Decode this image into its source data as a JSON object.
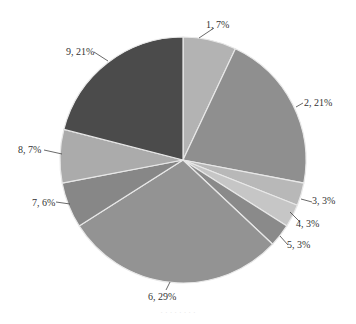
{
  "chart_data": {
    "type": "pie",
    "title": "",
    "start_angle_deg": 0,
    "direction": "clockwise",
    "slices": [
      {
        "name": "1",
        "value": 7,
        "label": "1, 7%",
        "color": "#b3b3b3"
      },
      {
        "name": "2",
        "value": 21,
        "label": "2, 21%",
        "color": "#8f8f8f"
      },
      {
        "name": "3",
        "value": 3,
        "label": "3, 3%",
        "color": "#b8b8b8"
      },
      {
        "name": "4",
        "value": 3,
        "label": "4, 3%",
        "color": "#c6c6c6"
      },
      {
        "name": "5",
        "value": 3,
        "label": "5, 3%",
        "color": "#8a8a8a"
      },
      {
        "name": "6",
        "value": 29,
        "label": "6, 29%",
        "color": "#939393"
      },
      {
        "name": "7",
        "value": 6,
        "label": "7, 6%",
        "color": "#878787"
      },
      {
        "name": "8",
        "value": 7,
        "label": "8, 7%",
        "color": "#ababab"
      },
      {
        "name": "9",
        "value": 21,
        "label": "9, 21%",
        "color": "#4b4b4b"
      }
    ],
    "legend": "none",
    "data_labels": "outside with leader lines"
  },
  "layout": {
    "center": [
      183,
      160
    ],
    "radius": 123,
    "separator_color": "#e8e8e8"
  },
  "label_positions": [
    {
      "x": 206,
      "y": 28,
      "anchor": "start",
      "lx1": 199,
      "ly1": 38,
      "lx2": 214,
      "ly2": 28
    },
    {
      "x": 304,
      "y": 106,
      "anchor": "start",
      "lx1": 296,
      "ly1": 107,
      "lx2": 303,
      "ly2": 103
    },
    {
      "x": 312,
      "y": 204,
      "anchor": "start",
      "lx1": 301,
      "ly1": 199,
      "lx2": 312,
      "ly2": 202
    },
    {
      "x": 296,
      "y": 227,
      "anchor": "start",
      "lx1": 290,
      "ly1": 212,
      "lx2": 300,
      "ly2": 222
    },
    {
      "x": 287,
      "y": 248,
      "anchor": "start",
      "lx1": 280,
      "ly1": 236,
      "lx2": 288,
      "ly2": 245
    },
    {
      "x": 148,
      "y": 300,
      "anchor": "start",
      "lx1": 170,
      "ly1": 282,
      "lx2": 166,
      "ly2": 290
    },
    {
      "x": 32,
      "y": 206,
      "anchor": "start",
      "lx1": 56,
      "ly1": 202,
      "lx2": 70,
      "ly2": 204
    },
    {
      "x": 18,
      "y": 153,
      "anchor": "start",
      "lx1": 44,
      "ly1": 150,
      "lx2": 62,
      "ly2": 154
    },
    {
      "x": 66,
      "y": 55,
      "anchor": "start",
      "lx1": 94,
      "ly1": 52,
      "lx2": 108,
      "ly2": 61
    }
  ],
  "caption": "· · · · · · · ·"
}
